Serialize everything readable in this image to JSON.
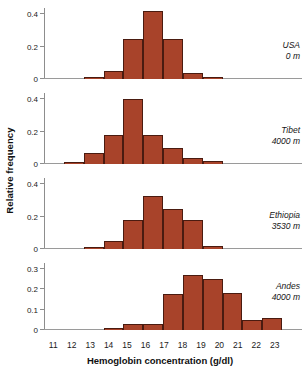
{
  "chart_data": {
    "type": "bar",
    "title": "",
    "xlabel": "Hemoglobin concentration (g/dl)",
    "ylabel": "Relative frequency",
    "xlim": [
      10.5,
      23.5
    ],
    "xticks": [
      11,
      12,
      13,
      14,
      15,
      16,
      17,
      18,
      19,
      20,
      21,
      22,
      23
    ],
    "grid": false,
    "legend_position": "in-panel-right",
    "bin_centers": [
      11,
      12,
      13,
      14,
      15,
      16,
      17,
      18,
      19,
      20,
      21,
      22,
      23
    ],
    "panels": [
      {
        "name": "USA",
        "altitude": "0 m",
        "ylim": [
          0,
          0.44
        ],
        "yticks": [
          0,
          0.2,
          0.4
        ],
        "ytick_labels": [
          "0",
          "0.2",
          "0.4"
        ],
        "values": [
          0,
          0,
          0.01,
          0.05,
          0.25,
          0.42,
          0.25,
          0.04,
          0.01,
          0,
          0,
          0,
          0
        ]
      },
      {
        "name": "Tibet",
        "altitude": "4000 m",
        "ylim": [
          0,
          0.44
        ],
        "yticks": [
          0,
          0.2,
          0.4
        ],
        "ytick_labels": [
          "0",
          "0.2",
          "0.4"
        ],
        "values": [
          0,
          0.01,
          0.07,
          0.18,
          0.4,
          0.18,
          0.1,
          0.04,
          0.02,
          0,
          0,
          0,
          0
        ]
      },
      {
        "name": "Ethiopia",
        "altitude": "3530 m",
        "ylim": [
          0,
          0.44
        ],
        "yticks": [
          0,
          0.2,
          0.4
        ],
        "ytick_labels": [
          "0",
          "0.2",
          "0.4"
        ],
        "values": [
          0,
          0,
          0.01,
          0.05,
          0.18,
          0.33,
          0.25,
          0.18,
          0.02,
          0,
          0,
          0,
          0
        ]
      },
      {
        "name": "Andes",
        "altitude": "4000 m",
        "ylim": [
          0,
          0.33
        ],
        "yticks": [
          0,
          0.1,
          0.2,
          0.3
        ],
        "ytick_labels": [
          "0",
          "0.1",
          "0.2",
          "0.3"
        ],
        "values": [
          0,
          0,
          0,
          0.01,
          0.03,
          0.03,
          0.175,
          0.27,
          0.25,
          0.18,
          0.05,
          0.06,
          0
        ]
      }
    ],
    "colors": {
      "bar_fill": "#a8432a",
      "bar_stroke": "#4a1b10",
      "axis": "#8d8d8d",
      "text": "#1a1a1a",
      "background": "#ffffff"
    }
  }
}
